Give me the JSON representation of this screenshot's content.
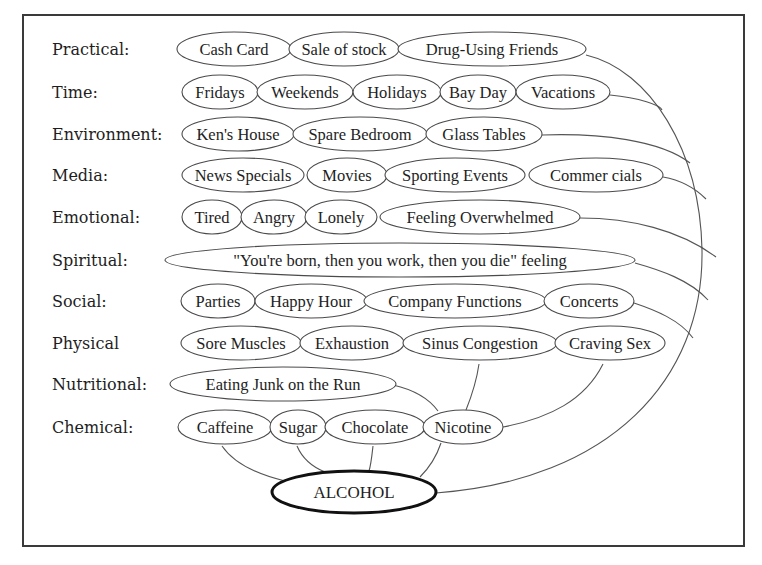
{
  "diagram": {
    "hub": {
      "label": "ALCOHOL",
      "cx": 354,
      "cy": 492,
      "rx": 82,
      "ry": 21
    },
    "rows": [
      {
        "category": "Practical:",
        "y": 49,
        "nodes": [
          {
            "label": "Cash Card",
            "cx": 234,
            "rx": 57
          },
          {
            "label": "Sale of stock",
            "cx": 344,
            "rx": 55
          },
          {
            "label": "Drug-Using Friends",
            "cx": 492,
            "rx": 94
          }
        ]
      },
      {
        "category": "Time:",
        "y": 92,
        "nodes": [
          {
            "label": "Fridays",
            "cx": 220,
            "rx": 38
          },
          {
            "label": "Weekends",
            "cx": 305,
            "rx": 48
          },
          {
            "label": "Holidays",
            "cx": 397,
            "rx": 44
          },
          {
            "label": "Bay Day",
            "cx": 478,
            "rx": 38
          },
          {
            "label": "Vacations",
            "cx": 563,
            "rx": 47
          }
        ]
      },
      {
        "category": "Environment:",
        "y": 134,
        "nodes": [
          {
            "label": "Ken's House",
            "cx": 238,
            "rx": 56
          },
          {
            "label": "Spare Bedroom",
            "cx": 360,
            "rx": 67
          },
          {
            "label": "Glass Tables",
            "cx": 484,
            "rx": 58
          }
        ]
      },
      {
        "category": "Media:",
        "y": 175,
        "nodes": [
          {
            "label": "News Specials",
            "cx": 243,
            "rx": 61
          },
          {
            "label": "Movies",
            "cx": 347,
            "rx": 40
          },
          {
            "label": "Sporting Events",
            "cx": 455,
            "rx": 70
          },
          {
            "label": "Commer cials",
            "cx": 596,
            "rx": 67
          }
        ]
      },
      {
        "category": "Emotional:",
        "y": 217,
        "nodes": [
          {
            "label": "Tired",
            "cx": 212,
            "rx": 30
          },
          {
            "label": "Angry",
            "cx": 274,
            "rx": 33
          },
          {
            "label": "Lonely",
            "cx": 341,
            "rx": 36
          },
          {
            "label": "Feeling Overwhelmed",
            "cx": 480,
            "rx": 100
          }
        ]
      },
      {
        "category": "Spiritual:",
        "y": 260,
        "nodes": [
          {
            "label": "\"You're born, then you work, then you die\" feeling",
            "cx": 400,
            "rx": 235
          }
        ]
      },
      {
        "category": "Social:",
        "y": 301,
        "nodes": [
          {
            "label": "Parties",
            "cx": 218,
            "rx": 37
          },
          {
            "label": "Happy Hour",
            "cx": 311,
            "rx": 56
          },
          {
            "label": "Company Functions",
            "cx": 455,
            "rx": 91
          },
          {
            "label": "Concerts",
            "cx": 589,
            "rx": 45
          }
        ]
      },
      {
        "category": "Physical",
        "y": 343,
        "nodes": [
          {
            "label": "Sore Muscles",
            "cx": 241,
            "rx": 60
          },
          {
            "label": "Exhaustion",
            "cx": 352,
            "rx": 52
          },
          {
            "label": "Sinus Congestion",
            "cx": 480,
            "rx": 77
          },
          {
            "label": "Craving Sex",
            "cx": 610,
            "rx": 55
          }
        ]
      },
      {
        "category": "Nutritional:",
        "y": 384,
        "nodes": [
          {
            "label": "Eating Junk on the Run",
            "cx": 283,
            "rx": 113
          }
        ]
      },
      {
        "category": "Chemical:",
        "y": 427,
        "nodes": [
          {
            "label": "Caffeine",
            "cx": 225,
            "rx": 47
          },
          {
            "label": "Sugar",
            "cx": 298,
            "rx": 28
          },
          {
            "label": "Chocolate",
            "cx": 375,
            "rx": 50
          },
          {
            "label": "Nicotine",
            "cx": 463,
            "rx": 40
          }
        ]
      }
    ],
    "connectors": [
      {
        "from": "Drug-Using Friends",
        "to": "ALCOHOL",
        "d": "M 586 55 C 650 70, 700 150, 702 250 C 704 380, 610 480, 436 493"
      },
      {
        "from": "Vacations",
        "to": "outer-arc",
        "d": "M 610 95 C 640 98, 660 105, 662 110"
      },
      {
        "from": "Glass Tables",
        "to": "outer-arc",
        "d": "M 542 135 C 600 133, 660 140, 690 163"
      },
      {
        "from": "Commer cials",
        "to": "outer-arc",
        "d": "M 663 177 C 680 180, 695 188, 706 199"
      },
      {
        "from": "Feeling Overwhelmed",
        "to": "outer-arc",
        "d": "M 580 218 C 630 218, 680 230, 716 257"
      },
      {
        "from": "Spiritual",
        "to": "outer-arc",
        "d": "M 635 263 C 660 270, 690 280, 708 300"
      },
      {
        "from": "Concerts",
        "to": "outer-arc",
        "d": "M 634 303 C 655 310, 680 320, 693 338"
      },
      {
        "from": "Craving Sex",
        "to": "Nicotine",
        "d": "M 603 364 C 585 400, 550 418, 503 427"
      },
      {
        "from": "Sinus Congestion",
        "to": "Nicotine",
        "d": "M 479 364 C 476 385, 470 400, 466 410"
      },
      {
        "from": "Eating Junk on the Run",
        "to": "Nicotine",
        "d": "M 393 385 C 415 390, 430 400, 438 411"
      },
      {
        "from": "Caffeine",
        "to": "ALCOHOL",
        "d": "M 222 446 C 235 465, 260 475, 285 481"
      },
      {
        "from": "Sugar",
        "to": "ALCOHOL",
        "d": "M 297 446 C 303 460, 315 468, 325 472"
      },
      {
        "from": "Chocolate",
        "to": "ALCOHOL",
        "d": "M 373 446 C 372 455, 371 465, 369 471"
      },
      {
        "from": "Nicotine",
        "to": "ALCOHOL",
        "d": "M 441 443 C 437 455, 430 467, 420 477"
      }
    ]
  },
  "frame": {
    "x": 23,
    "y": 15,
    "width": 721,
    "height": 531
  },
  "label_x": 52
}
